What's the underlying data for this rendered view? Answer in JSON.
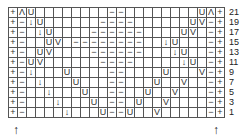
{
  "chart": {
    "columns": 24,
    "legend_symbols": {
      "+": "edge stitch",
      "−": "purl",
      "U": "yarn over",
      "↓": "decrease",
      "V": "decrease",
      "Λ": "double decrease",
      "": "knit"
    },
    "rows": [
      {
        "label": "21",
        "cells": [
          "+",
          "Λ",
          "U",
          "",
          "",
          "",
          "",
          "",
          "",
          "",
          "",
          "−",
          "−",
          "",
          "",
          "",
          "",
          "",
          "",
          "",
          "",
          "U",
          "Λ",
          "+"
        ]
      },
      {
        "label": "19",
        "cells": [
          "+",
          "−",
          "↓",
          "U",
          "",
          "",
          "",
          "",
          "",
          "",
          "−",
          "−",
          "−",
          "−",
          "",
          "",
          "",
          "",
          "",
          "",
          "U",
          "V",
          "−",
          "+"
        ]
      },
      {
        "label": "17",
        "cells": [
          "+",
          "−",
          "",
          "↓",
          "U",
          "",
          "",
          "",
          "",
          "−",
          "−",
          "−",
          "−",
          "−",
          "−",
          "",
          "",
          "",
          "",
          "U",
          "V",
          "",
          "−",
          "+"
        ]
      },
      {
        "label": "15",
        "cells": [
          "+",
          "−",
          "",
          "",
          "U",
          "V",
          "",
          "−",
          "−",
          "−",
          "−",
          "−",
          "−",
          "−",
          "−",
          "",
          "",
          "↓",
          "U",
          "",
          "",
          "",
          "−",
          "+"
        ]
      },
      {
        "label": "13",
        "cells": [
          "+",
          "−",
          "",
          "U",
          "V",
          "",
          "",
          "",
          "",
          "−",
          "−",
          "−",
          "−",
          "−",
          "−",
          "",
          "",
          "",
          "↓",
          "U",
          "",
          "",
          "−",
          "+"
        ]
      },
      {
        "label": "11",
        "cells": [
          "+",
          "−",
          "U",
          "V",
          "",
          "",
          "",
          "",
          "",
          "",
          "−",
          "−",
          "−",
          "−",
          "",
          "",
          "",
          "",
          "",
          "↓",
          "U",
          "",
          "−",
          "+"
        ]
      },
      {
        "label": "9",
        "cells": [
          "+",
          "−",
          "↓",
          "",
          "",
          "",
          "U",
          "",
          "",
          "",
          "",
          "−",
          "−",
          "",
          "",
          "",
          "",
          "U",
          "",
          "",
          "",
          "V",
          "−",
          "+"
        ]
      },
      {
        "label": "7",
        "cells": [
          "+",
          "−",
          "",
          "↓",
          "",
          "",
          "",
          "U",
          "",
          "",
          "",
          "−",
          "−",
          "",
          "",
          "",
          "U",
          "",
          "",
          "V",
          "",
          "",
          "−",
          "+"
        ]
      },
      {
        "label": "5",
        "cells": [
          "+",
          "−",
          "",
          "",
          "↓",
          "",
          "",
          "",
          "U",
          "",
          "",
          "−",
          "−",
          "",
          "",
          "U",
          "",
          "",
          "V",
          "",
          "",
          "",
          "−",
          "+"
        ]
      },
      {
        "label": "3",
        "cells": [
          "+",
          "−",
          "",
          "",
          "",
          "↓",
          "",
          "",
          "",
          "U",
          "",
          "−",
          "−",
          "",
          "U",
          "",
          "",
          "V",
          "",
          "",
          "",
          "",
          "−",
          "+"
        ]
      },
      {
        "label": "1",
        "cells": [
          "+",
          "−",
          "",
          "",
          "",
          "",
          "↓",
          "",
          "",
          "",
          "U",
          "−",
          "−",
          "U",
          "",
          "",
          "V",
          "",
          "",
          "",
          "",
          "",
          "−",
          "+"
        ]
      }
    ],
    "start_arrows": [
      "↑",
      "↑"
    ]
  }
}
